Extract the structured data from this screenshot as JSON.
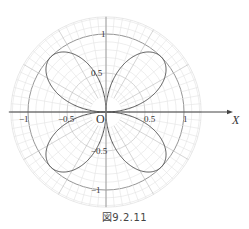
{
  "caption": "図9.2.11",
  "chart_data": {
    "type": "line",
    "subtype": "polar",
    "title": "",
    "equation_hint": "four-petal rose r = |sin 2θ|",
    "series": [
      {
        "name": "rose",
        "petals": 4,
        "amplitude": 1,
        "petal_axes_deg": [
          45,
          135,
          225,
          315
        ],
        "color": "#555555"
      }
    ],
    "axis": {
      "x_label": "X",
      "origin_label": "O",
      "x_ticks": [
        {
          "value": -1,
          "label": "−1"
        },
        {
          "value": -0.5,
          "label": "−0.5"
        },
        {
          "value": 0.5,
          "label": "0.5"
        },
        {
          "value": 1,
          "label": "1"
        }
      ],
      "y_ticks": [
        {
          "value": 1,
          "label": "1"
        },
        {
          "value": 0.5,
          "label": "0.5"
        },
        {
          "value": -0.5,
          "label": "−0.5"
        },
        {
          "value": -1,
          "label": "−1"
        }
      ]
    },
    "grid": {
      "on": true,
      "circle_step": 0.1,
      "outer_radius": 1.22,
      "major_circles": [
        0.5,
        1
      ],
      "radial_minor_deg": 10,
      "radial_major_deg": 30,
      "outer_ring_minor_deg": 5,
      "center_hole_radius": 0.2
    },
    "ylim": [
      -1.22,
      1.22
    ],
    "xlim": [
      -1.22,
      1.22
    ]
  },
  "layout": {
    "cx": 106,
    "cy": 112,
    "unit_px": 78,
    "axis_arrow_end_x": 230
  },
  "colors": {
    "grid_light": "#e2e2e2",
    "grid_major": "#b8b8b8",
    "circle_one": "#888888",
    "axis": "#444444",
    "curve": "#555555",
    "text": "#333333"
  }
}
